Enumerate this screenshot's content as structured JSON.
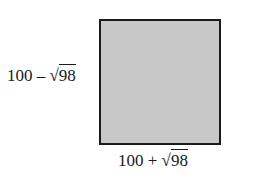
{
  "diagram": {
    "shape": "rectangle",
    "fill_color": "#c8c8c8",
    "stroke_color": "#1a1a1a",
    "height_label": {
      "base": "100",
      "operator": "–",
      "radical_sign": "√",
      "radicand": "98"
    },
    "width_label": {
      "base": "100",
      "operator": "+",
      "radical_sign": "√",
      "radicand": "98"
    }
  }
}
